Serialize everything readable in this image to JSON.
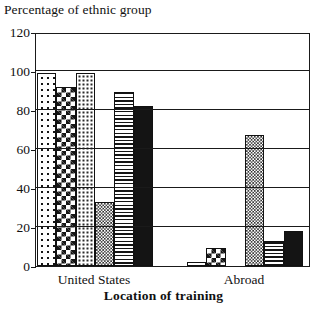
{
  "chart": {
    "ylabel": "Percentage of ethnic group",
    "xlabel": "Location of training"
  },
  "chart_data": {
    "type": "bar",
    "title": "",
    "subtitle": "",
    "ylabel": "Percentage of ethnic group",
    "xlabel": "Location of training",
    "categories": [
      "United States",
      "Abroad"
    ],
    "ylim": [
      0,
      120
    ],
    "yticks": [
      0,
      20,
      40,
      60,
      80,
      100,
      120
    ],
    "ytick_labels": [
      "0",
      "20",
      "40",
      "60",
      "80",
      "100",
      "120"
    ],
    "grid": true,
    "legend": "none",
    "series": [
      {
        "name": "series-1",
        "pattern": "sparse-dots",
        "values": [
          99,
          2
        ]
      },
      {
        "name": "series-2",
        "pattern": "checkerboard",
        "values": [
          92,
          9
        ]
      },
      {
        "name": "series-3",
        "pattern": "fine-dots",
        "values": [
          99,
          0
        ]
      },
      {
        "name": "series-4",
        "pattern": "cross-hatch",
        "values": [
          33,
          67
        ]
      },
      {
        "name": "series-5",
        "pattern": "h-stripes",
        "values": [
          89,
          13
        ]
      },
      {
        "name": "series-6",
        "pattern": "solid-black",
        "values": [
          82,
          18
        ]
      }
    ]
  }
}
